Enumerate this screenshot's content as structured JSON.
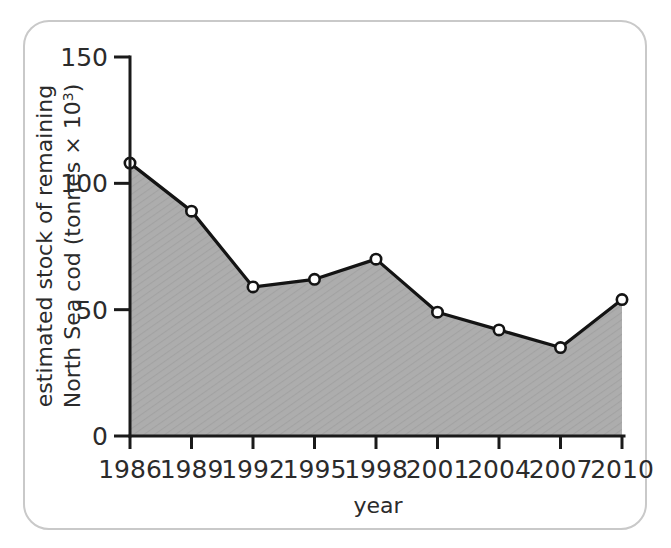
{
  "chart_data": {
    "type": "area",
    "title": "",
    "subtitle": "",
    "xlabel": "year",
    "ylabel": "estimated stock of remaining North Sea cod (tonnes × 10³)",
    "ylabel_line1": "estimated stock of remaining",
    "ylabel_line2_prefix": "North Sea cod (tonnes × 10",
    "ylabel_line2_sup": "3",
    "ylabel_line2_suffix": ")",
    "categories": [
      "1986",
      "1989",
      "1992",
      "1995",
      "1998",
      "2001",
      "2004",
      "2007",
      "2010"
    ],
    "x": [
      1986,
      1989,
      1992,
      1995,
      1998,
      2001,
      2004,
      2007,
      2010
    ],
    "values": [
      108,
      89,
      59,
      62,
      70,
      49,
      42,
      35,
      54
    ],
    "series": [
      {
        "name": "estimated stock of remaining North Sea cod",
        "values": [
          108,
          89,
          59,
          62,
          70,
          49,
          42,
          35,
          54
        ]
      }
    ],
    "xlim": [
      1986,
      2010
    ],
    "ylim": [
      0,
      150
    ],
    "yticks": [
      0,
      50,
      100,
      150
    ],
    "ytick_labels": [
      "0",
      "50",
      "100",
      "150"
    ],
    "xticks": [
      1986,
      1989,
      1992,
      1995,
      1998,
      2001,
      2004,
      2007,
      2010
    ],
    "xtick_labels": [
      "1986",
      "1989",
      "1992",
      "1995",
      "1998",
      "2001",
      "2004",
      "2007",
      "2010"
    ],
    "grid": false,
    "legend": false,
    "legend_position": "none",
    "marker_style": "open-circle",
    "fill_color": "#a9a9a9",
    "line_color": "#141414",
    "marker_fill": "#ffffff",
    "axis_color": "#1a1a1a",
    "border_color": "#c9c9c9",
    "background": "#ffffff"
  }
}
